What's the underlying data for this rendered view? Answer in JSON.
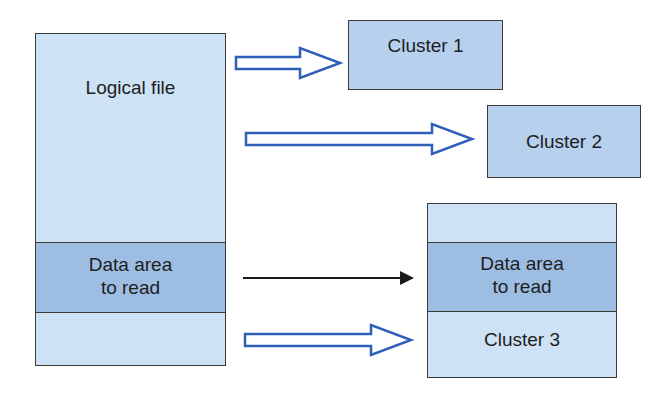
{
  "diagram": {
    "logical_file": {
      "label": "Logical file",
      "data_area_label_line1": "Data area",
      "data_area_label_line2": "to read"
    },
    "clusters": [
      {
        "label": "Cluster 1"
      },
      {
        "label": "Cluster 2"
      },
      {
        "label": "Cluster 3",
        "data_area_label_line1": "Data area",
        "data_area_label_line2": "to read"
      }
    ],
    "arrows": [
      {
        "from": "Logical file",
        "to": "Cluster 1",
        "style": "hollow-blue"
      },
      {
        "from": "Logical file",
        "to": "Cluster 2",
        "style": "hollow-blue"
      },
      {
        "from": "Data area to read",
        "to": "Data area to read (Cluster 3)",
        "style": "thin-black"
      },
      {
        "from": "Logical file",
        "to": "Cluster 3",
        "style": "hollow-blue"
      }
    ],
    "colors": {
      "light_fill": "#cde2f4",
      "cluster_fill": "#b6d0ee",
      "data_area_fill": "#9dbde3",
      "arrow_blue": "#2f5fb8",
      "border": "#3a3a3a"
    }
  }
}
